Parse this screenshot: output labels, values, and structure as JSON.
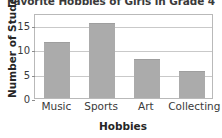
{
  "chart_data": {
    "type": "bar",
    "title": "Favorite Hobbies of Girls in Grade 4",
    "xlabel": "Hobbies",
    "ylabel": "Number of Students",
    "categories": [
      "Music",
      "Sports",
      "Art",
      "Collecting"
    ],
    "values": [
      11.5,
      15.5,
      8,
      5.5
    ],
    "ylim": [
      0,
      17.5
    ],
    "yticks": [
      0,
      5,
      10,
      15
    ],
    "ytick_labels": [
      "0",
      "5",
      "10",
      "15"
    ],
    "grid": true,
    "legend": false,
    "bar_color": "#ababab",
    "background_color": "#ffffff",
    "axis_color": "#b9b9b9",
    "grid_color": "#c9c9c9"
  }
}
